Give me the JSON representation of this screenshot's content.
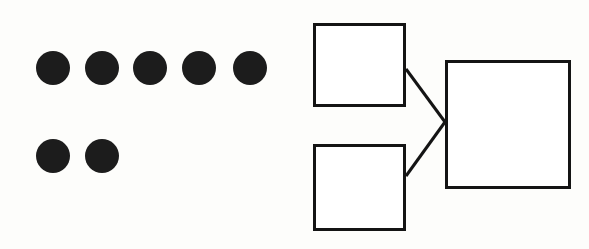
{
  "image": {
    "title": "Dot array and linked box diagram",
    "width": 589,
    "height": 249,
    "background_color": "#fdfdfb",
    "ink_color": "#141414"
  },
  "dot_group": {
    "name": "dot-array",
    "description": "Seven solid black filled circles arranged in two rows",
    "total_count": 7,
    "fill_color": "#1c1c1c",
    "diameter": 35,
    "rows": [
      {
        "row_index": 0,
        "count": 5,
        "dots": [
          {
            "label": "dot-1",
            "cx": 53,
            "cy": 68,
            "r": 17
          },
          {
            "label": "dot-2",
            "cx": 102,
            "cy": 68,
            "r": 17
          },
          {
            "label": "dot-3",
            "cx": 150,
            "cy": 68,
            "r": 17
          },
          {
            "label": "dot-4",
            "cx": 199,
            "cy": 68,
            "r": 17
          },
          {
            "label": "dot-5",
            "cx": 250,
            "cy": 68,
            "r": 17
          }
        ]
      },
      {
        "row_index": 1,
        "count": 2,
        "dots": [
          {
            "label": "dot-6",
            "cx": 53,
            "cy": 156,
            "r": 17
          },
          {
            "label": "dot-7",
            "cx": 102,
            "cy": 156,
            "r": 17
          }
        ]
      }
    ]
  },
  "diagram": {
    "name": "box-connector-diagram",
    "stroke_color": "#141414",
    "fill_color": "#ffffff",
    "stroke_width": 3,
    "nodes": [
      {
        "id": "node-top-left",
        "label": "",
        "x": 18,
        "y": 23,
        "width": 93,
        "height": 84
      },
      {
        "id": "node-bottom-left",
        "label": "",
        "x": 18,
        "y": 144,
        "width": 93,
        "height": 87
      },
      {
        "id": "node-right",
        "label": "",
        "x": 150,
        "y": 60,
        "width": 126,
        "height": 129
      }
    ],
    "connectors": [
      {
        "id": "connector-top",
        "from": "node-top-left",
        "to": "node-right",
        "x1": 111,
        "y1": 69,
        "x2": 150,
        "y2": 122
      },
      {
        "id": "connector-bottom",
        "from": "node-bottom-left",
        "to": "node-right",
        "x1": 111,
        "y1": 176,
        "x2": 150,
        "y2": 122
      }
    ],
    "junction": {
      "x": 150,
      "y": 122
    }
  }
}
